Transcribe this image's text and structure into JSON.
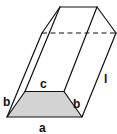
{
  "diagram": {
    "labels": {
      "a": "a",
      "b_left": "b",
      "b_right": "b",
      "c": "c",
      "l": "l"
    },
    "colors": {
      "base_fill": "#d3d3d3",
      "stroke": "#111111",
      "background": "#ffffff"
    }
  }
}
